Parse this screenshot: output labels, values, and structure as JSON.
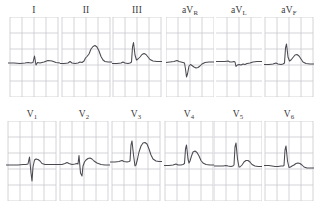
{
  "document": {
    "title": "12-Lead Electrocardiogram",
    "layout": "3 rows x 6 columns standard 12-lead display",
    "background_color": "#ffffff",
    "grid_color": "#c9c9cf",
    "trace_color": "#4a4a52",
    "label_color": "#3a3a3a"
  },
  "grid": {
    "cell_width": 12,
    "cell_height": 16,
    "columns": 4,
    "rows": 5
  },
  "rows": [
    {
      "name": "limb-leads",
      "leads": [
        {
          "id": "I",
          "label": "I",
          "label_base": "I",
          "label_sub": "",
          "x": 8,
          "width": 52,
          "baseline": 46,
          "description": "Low voltage QRS, small R wave, flat ST segment",
          "points": "0,46 6,46 12,46.5 17,46 20,45.5 23,46 25,45.5 26.5,39 28,48 29.5,45.5 32,46 36,45 40,43.5 44,44 48,45.5 52,46"
        },
        {
          "id": "II",
          "label": "II",
          "label_base": "II",
          "label_sub": "",
          "x": 60,
          "width": 52,
          "baseline": 46,
          "description": "Upsloping ST elevation with broad tall T wave hump",
          "points": "0,46.5 4,46.5 8,46 10,44.5 12,46 15,46.5 18,46 20,45 22,45.5 24,44 25.5,41 27,39.5 29,37 31,32 33,29.5 35,28.5 37,30 39,34 41,39.5 43,43 45,44.5 48,45 52,45"
        },
        {
          "id": "III",
          "label": "III",
          "label_base": "III",
          "label_sub": "",
          "x": 112,
          "width": 50,
          "baseline": 46,
          "description": "Tall narrow R wave followed by rounded elevated T wave",
          "points": "0,46.5 5,46.5 9,46 11,45 13,46 16,46.5 18,46 19.5,45 20.5,30 21.5,25.5 23,38 24.5,43 26,42 28,40 30,37.5 32,36.5 34,37.5 36,40 38,42.5 41,44 45,44.5 50,44.5"
        },
        {
          "id": "aVR",
          "label": "aVR",
          "label_base": "aV",
          "label_sub": "R",
          "x": 166,
          "width": 48,
          "baseline": 46,
          "description": "Deep negative QS complex with inverted T wave",
          "points": "0,45.5 4,45 8,44.5 11,43.5 13,44.5 15,45 17,45.5 18.5,46 19.5,52 20.5,60 21.5,57 23,49 24.5,47.5 26,48.5 28,50 30,51 32,50.5 34,49 36,47 39,45.5 43,45 48,45"
        },
        {
          "id": "aVL",
          "label": "aVL",
          "label_base": "aV",
          "label_sub": "L",
          "x": 216,
          "width": 46,
          "baseline": 45,
          "description": "Low amplitude, nearly isoelectric with small negative deflection",
          "points": "0,44.5 5,44.5 9,44.5 12,44 14,45 16,45 18,44.5 19,45 20,49.5 21.5,48 23,47.5 25,48 27,47 29,47.5 31,46.5 34,46 37,45 41,44.5 46,44.5"
        },
        {
          "id": "aVF",
          "label": "aVF",
          "label_base": "aV",
          "label_sub": "F",
          "x": 264,
          "width": 50,
          "baseline": 47,
          "description": "Tall R wave with elevated rounded T wave hump",
          "points": "0,47.5 5,47.5 9,47 12,46 14,47 17,47.5 19,47 20.5,46 21.5,31 22.5,27 24,40 25.5,44 27,43 29,40.5 31,38 33,37.5 35,39 37,42 39,45 42,46.5 46,47 50,47"
        }
      ]
    },
    {
      "name": "chest-leads",
      "leads": [
        {
          "id": "V1",
          "label": "V1",
          "label_base": "V",
          "label_sub": "1",
          "x": 6,
          "width": 52,
          "baseline": 44,
          "description": "Small r wave with deep S wave, rS pattern",
          "points": "0,44 6,44 12,44 17,43.5 20,43.5 22,43 23.5,36 25,52 26,60 27,46 28.5,39 30,38 32,38.5 34,40 36,42.5 39,43.5 44,43.5 52,43.5"
        },
        {
          "id": "V2",
          "label": "V2",
          "label_base": "V",
          "label_sub": "2",
          "x": 58,
          "width": 52,
          "baseline": 43,
          "description": "rS complex with broad rounded T wave",
          "points": "0,43.5 4,43.5 7,42.5 9,41.5 11,42.5 14,43.5 17,43 19,42.5 20,43 21,34.5 22.5,52 24,55 25,45 26.5,41 28,39 30,37.5 32,37 34,38 36,40 39,42 43,43.5 47,44 52,44"
        },
        {
          "id": "V3",
          "label": "V3",
          "label_base": "V",
          "label_sub": "3",
          "x": 110,
          "width": 52,
          "baseline": 41,
          "description": "Tall R wave, small S, followed by tall broad T wave",
          "points": "0,41 5,41 9,40.5 12,39.5 14,40.5 17,41 19,40.5 20,40 21,24 22,20 23.5,34 25,45 26,44 27.5,38 29,31 31,25 33,22 35,21.5 37,23 39,28 41,34 43,38 46,40 49,40.5 52,40.5"
        },
        {
          "id": "V4",
          "label": "V4",
          "label_base": "V",
          "label_sub": "4",
          "x": 164,
          "width": 50,
          "baseline": 44,
          "description": "Tall R wave with prominent T wave hump",
          "points": "0,44.5 5,44.5 9,44 12,43 14,44 17,44 19,43.5 20.5,42.5 21.5,28 22.5,24 24,38 25,42 26,40 27.5,35 29,31 31,30 33,31.5 35,35 37,39.5 39,42 42,43.5 46,44 50,44"
        },
        {
          "id": "V5",
          "label": "V5",
          "label_base": "V",
          "label_sub": "5",
          "x": 214,
          "width": 48,
          "baseline": 45,
          "description": "Tall narrow R wave with moderate T wave",
          "points": "0,45 5,45 9,45 12,44.5 14,45 17,45.5 19,45 20,44 21,26 22,22 23.5,38 25,46 26,46 28,44 30,41 32,39.5 34,39.5 36,41 38,43.5 41,45 44,45.5 48,45.5"
        },
        {
          "id": "V6",
          "label": "V6",
          "label_base": "V",
          "label_sub": "6",
          "x": 264,
          "width": 50,
          "baseline": 45,
          "description": "Narrow tall R wave with small T wave and slight ST depression",
          "points": "0,44.5 5,44.5 8,45 11,45.5 14,45.5 17,45 19,45 20,44.5 21,29 22,25 23.5,40 25,46.5 26.5,46 28,45 30,44 32,42.5 34,42 36,42.5 38,44 40,46 43,47 46,47 50,47"
        }
      ]
    }
  ]
}
